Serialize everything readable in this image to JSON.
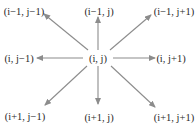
{
  "diagram": {
    "colors": {
      "arrow": "#8c8c8c",
      "text": "#2a2a2a",
      "background": "#ffffff"
    },
    "center": {
      "label": "(i, j)",
      "x": 98,
      "y": 58
    },
    "neighbors": [
      {
        "id": "top-left",
        "label": "(i−1, j−1)",
        "label_x": 24,
        "label_y": 11,
        "arrow_from": [
          88,
          50
        ],
        "arrow_to": [
          44,
          14
        ]
      },
      {
        "id": "top",
        "label": "(i−1, j)",
        "label_x": 99,
        "label_y": 11,
        "arrow_from": [
          98,
          50
        ],
        "arrow_to": [
          98,
          17
        ]
      },
      {
        "id": "top-right",
        "label": "(i−1, j+1)",
        "label_x": 174,
        "label_y": 11,
        "arrow_from": [
          110,
          50
        ],
        "arrow_to": [
          151,
          15
        ]
      },
      {
        "id": "left",
        "label": "(i, j−1)",
        "label_x": 19,
        "label_y": 58,
        "arrow_from": [
          83,
          58
        ],
        "arrow_to": [
          37,
          58
        ]
      },
      {
        "id": "right",
        "label": "(i, j+1)",
        "label_x": 171,
        "label_y": 58,
        "arrow_from": [
          113,
          58
        ],
        "arrow_to": [
          155,
          58
        ]
      },
      {
        "id": "bottom-left",
        "label": "(i+1, j−1)",
        "label_x": 25,
        "label_y": 116,
        "arrow_from": [
          87,
          66
        ],
        "arrow_to": [
          45,
          105
        ]
      },
      {
        "id": "bottom",
        "label": "(i+1, j)",
        "label_x": 99,
        "label_y": 117,
        "arrow_from": [
          98,
          66
        ],
        "arrow_to": [
          98,
          104
        ]
      },
      {
        "id": "bottom-right",
        "label": "(i+1, j+1)",
        "label_x": 174,
        "label_y": 117,
        "arrow_from": [
          111,
          66
        ],
        "arrow_to": [
          155,
          107
        ]
      }
    ]
  }
}
